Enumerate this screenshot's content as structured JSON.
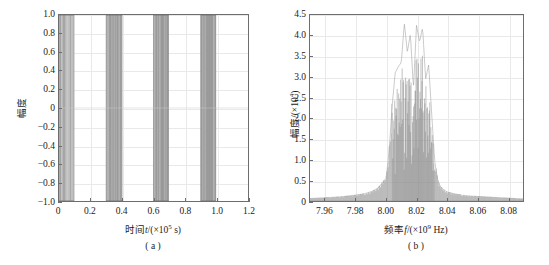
{
  "figure": {
    "background": "#ffffff",
    "axis_color": "#6d6d6d",
    "grid_color": "#e9e9e9",
    "trace_color": "#8a8a8a"
  },
  "panel_a": {
    "caption": "( a )",
    "xlabel_prefix": "时间",
    "xlabel_var": "t",
    "xlabel_unit_open": "/(×10",
    "xlabel_exp": "5",
    "xlabel_unit_close": " s)",
    "ylabel": "幅度",
    "xticks": [
      "0",
      "0.2",
      "0.4",
      "0.6",
      "0.8",
      "1.0",
      "1.2"
    ],
    "yticks": [
      "1.0",
      "0.8",
      "0.6",
      "0.4",
      "0.2",
      "0",
      "−0.2",
      "−0.4",
      "−0.6",
      "−0.8",
      "−1.0"
    ]
  },
  "panel_b": {
    "caption": "( b )",
    "xlabel_prefix": "频率",
    "xlabel_var": "f",
    "xlabel_unit_open": "/(×10",
    "xlabel_exp": "9",
    "xlabel_unit_close": " Hz)",
    "ylabel_prefix": "幅度",
    "ylabel_unit_open": "/(×10",
    "ylabel_exp": "4",
    "ylabel_unit_close": ")",
    "xticks": [
      "7.96",
      "7.98",
      "8.00",
      "8.02",
      "8.04",
      "8.06",
      "8.08"
    ],
    "yticks": [
      "4.5",
      "4.0",
      "3.5",
      "3.0",
      "2.5",
      "2.0",
      "1.5",
      "1.0",
      "0.5",
      "0"
    ]
  },
  "chart_data": [
    {
      "type": "area",
      "id": "panel-a-waveform",
      "title": "( a )",
      "xlabel": "时间t/(×10^5 s)",
      "ylabel": "幅度",
      "xlim": [
        0,
        1.2
      ],
      "ylim": [
        -1.0,
        1.0
      ],
      "xticks": [
        0,
        0.2,
        0.4,
        0.6,
        0.8,
        1.0,
        1.2
      ],
      "yticks": [
        -1.0,
        -0.8,
        -0.6,
        -0.4,
        -0.2,
        0,
        0.2,
        0.4,
        0.6,
        0.8,
        1.0
      ],
      "grid": true,
      "legend": "none",
      "description": "Dense oscillatory burst envelope, amplitude saturating at ±1.0 within four pulse groups, zero elsewhere.",
      "bursts": [
        {
          "x_start": 0.0,
          "x_end": 0.095,
          "amplitude": 1.0,
          "striped": true
        },
        {
          "x_start": 0.3,
          "x_end": 0.4,
          "amplitude": 1.0,
          "striped": false
        },
        {
          "x_start": 0.6,
          "x_end": 0.695,
          "amplitude": 1.0,
          "striped": false
        },
        {
          "x_start": 0.9,
          "x_end": 0.995,
          "amplitude": 1.0,
          "striped": false
        }
      ]
    },
    {
      "type": "area",
      "id": "panel-b-spectrum",
      "title": "( b )",
      "xlabel": "频率f/(×10^9 Hz)",
      "ylabel": "幅度/(×10^4)",
      "xlim": [
        7.95,
        8.09
      ],
      "ylim": [
        0,
        4.5
      ],
      "xticks": [
        7.96,
        7.98,
        8.0,
        8.02,
        8.04,
        8.06,
        8.08
      ],
      "yticks": [
        0,
        0.5,
        1.0,
        1.5,
        2.0,
        2.5,
        3.0,
        3.5,
        4.0,
        4.5
      ],
      "grid": true,
      "legend": "none",
      "description": "Spectral magnitude with a jagged main lobe centred near 8.02 GHz reaching about 4.3, steep shoulders near 8.005 and 8.032, and low comb-like sidelobe skirts decaying from about 0.55 to 0.05 toward both edges.",
      "x": [
        7.95,
        7.955,
        7.96,
        7.965,
        7.97,
        7.975,
        7.98,
        7.985,
        7.99,
        7.995,
        8.0,
        8.002,
        8.004,
        8.006,
        8.008,
        8.01,
        8.012,
        8.014,
        8.016,
        8.018,
        8.02,
        8.022,
        8.024,
        8.026,
        8.028,
        8.03,
        8.032,
        8.034,
        8.036,
        8.04,
        8.045,
        8.05,
        8.055,
        8.06,
        8.065,
        8.07,
        8.075,
        8.08,
        8.085,
        8.09
      ],
      "values": [
        0.06,
        0.07,
        0.08,
        0.09,
        0.1,
        0.12,
        0.14,
        0.17,
        0.22,
        0.32,
        0.55,
        1.2,
        2.3,
        3.1,
        3.25,
        3.35,
        4.3,
        3.6,
        4.05,
        2.7,
        4.25,
        3.85,
        4.2,
        2.95,
        3.3,
        2.1,
        0.95,
        0.5,
        0.33,
        0.22,
        0.17,
        0.14,
        0.12,
        0.11,
        0.1,
        0.09,
        0.08,
        0.07,
        0.06,
        0.05
      ]
    }
  ]
}
